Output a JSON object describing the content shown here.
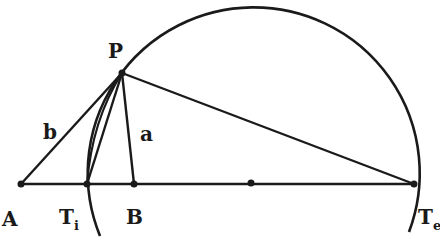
{
  "figure": {
    "labels": {
      "P": "P",
      "A": "A",
      "B": "B",
      "Ti_main": "T",
      "Ti_sub": "i",
      "Te_main": "T",
      "Te_sub": "e",
      "a": "a",
      "b": "b"
    },
    "colors": {
      "stroke": "#1a1a1a",
      "background": "#ffffff"
    }
  }
}
